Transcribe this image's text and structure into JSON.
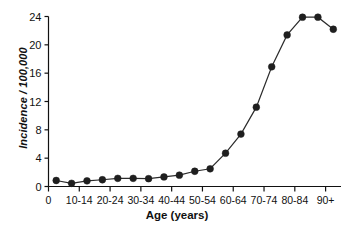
{
  "chart_data": {
    "type": "line",
    "title": "",
    "xlabel": "Age (years)",
    "ylabel": "Incidence / 100,000",
    "categories": [
      "0-4",
      "5-9",
      "10-14",
      "15-19",
      "20-24",
      "25-29",
      "30-34",
      "35-39",
      "40-44",
      "45-49",
      "50-54",
      "55-59",
      "60-64",
      "65-69",
      "70-74",
      "75-79",
      "80-84",
      "85-89",
      "90+"
    ],
    "values": [
      0.85,
      0.45,
      0.8,
      0.95,
      1.15,
      1.15,
      1.1,
      1.35,
      1.6,
      2.15,
      2.5,
      4.7,
      7.4,
      11.2,
      16.9,
      21.4,
      23.9,
      23.9,
      22.2
    ],
    "x_tick_labels": [
      "0",
      "10-14",
      "20-24",
      "30-34",
      "40-44",
      "50-54",
      "60-64",
      "70-74",
      "80-84",
      "90+"
    ],
    "y_tick_labels": [
      "0",
      "4",
      "8",
      "12",
      "16",
      "20",
      "24"
    ],
    "y_ticks": [
      0,
      4,
      8,
      12,
      16,
      20,
      24
    ],
    "ylim": [
      0,
      24
    ],
    "grid": false,
    "legend": "none",
    "marker": "filled-circle",
    "series_color": "#1f1f1f"
  },
  "axes": {
    "x_title": "Age (years)",
    "y_title": "Incidence / 100,000"
  }
}
